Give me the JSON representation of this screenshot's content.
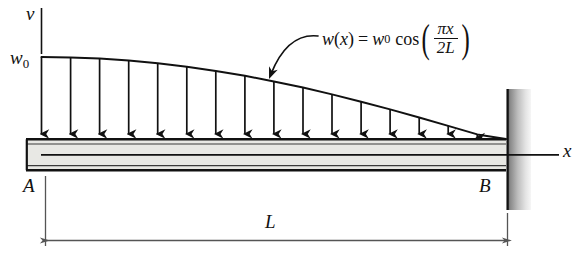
{
  "figure": {
    "labels": {
      "v_axis": "v",
      "x_axis": "x",
      "load_magnitude": "w",
      "load_magnitude_sub": "0",
      "point_a": "A",
      "point_b": "B",
      "length": "L"
    },
    "equation": {
      "lhs_fn": "w",
      "lhs_arg": "(x)",
      "equals": "=",
      "amplitude": "w",
      "amplitude_sub": "0",
      "trig": "cos",
      "paren_open": "(",
      "paren_close": ")",
      "numerator": "πx",
      "denominator": "2L"
    },
    "elements": {
      "beam_label": "beam",
      "wall_label": "fixed-wall-support",
      "load_arrows_count": 16,
      "load_curve_label": "cosine-load-curve",
      "leader_label": "equation-leader-arrow",
      "dimension_label": "length-dimension-line"
    },
    "colors": {
      "ink": "#111111",
      "beam_fill": "#e8e8e4",
      "wall_dark": "#6e6e6e",
      "wall_light": "#f2f2f2",
      "dimension": "#555555"
    }
  }
}
